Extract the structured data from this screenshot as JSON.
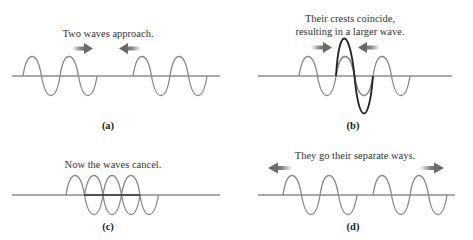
{
  "colors": {
    "background": "#ffffff",
    "baseline": "#555555",
    "wave": "#8a8a8a",
    "resultant_wave": "#222222",
    "arrow": "#7a7a7a",
    "text": "#333333"
  },
  "panels": [
    {
      "id": "a",
      "label": "(a)",
      "caption_lines": [
        "Two waves approach."
      ],
      "arrows": [
        "right",
        "left"
      ],
      "description": "Two separate wave pulses moving toward each other"
    },
    {
      "id": "b",
      "label": "(b)",
      "caption_lines": [
        "Their crests coincide,",
        "resulting in a larger wave."
      ],
      "arrows": [
        "right",
        "left"
      ],
      "description": "Constructive interference: crests overlap to produce a larger resultant wave"
    },
    {
      "id": "c",
      "label": "(c)",
      "caption_lines": [
        "Now the waves cancel."
      ],
      "arrows": [],
      "description": "Destructive interference: waves overlap out of phase and cancel"
    },
    {
      "id": "d",
      "label": "(d)",
      "caption_lines": [
        "They go their separate ways."
      ],
      "arrows": [
        "left",
        "right"
      ],
      "description": "Waves pass through each other and move apart unchanged"
    }
  ]
}
